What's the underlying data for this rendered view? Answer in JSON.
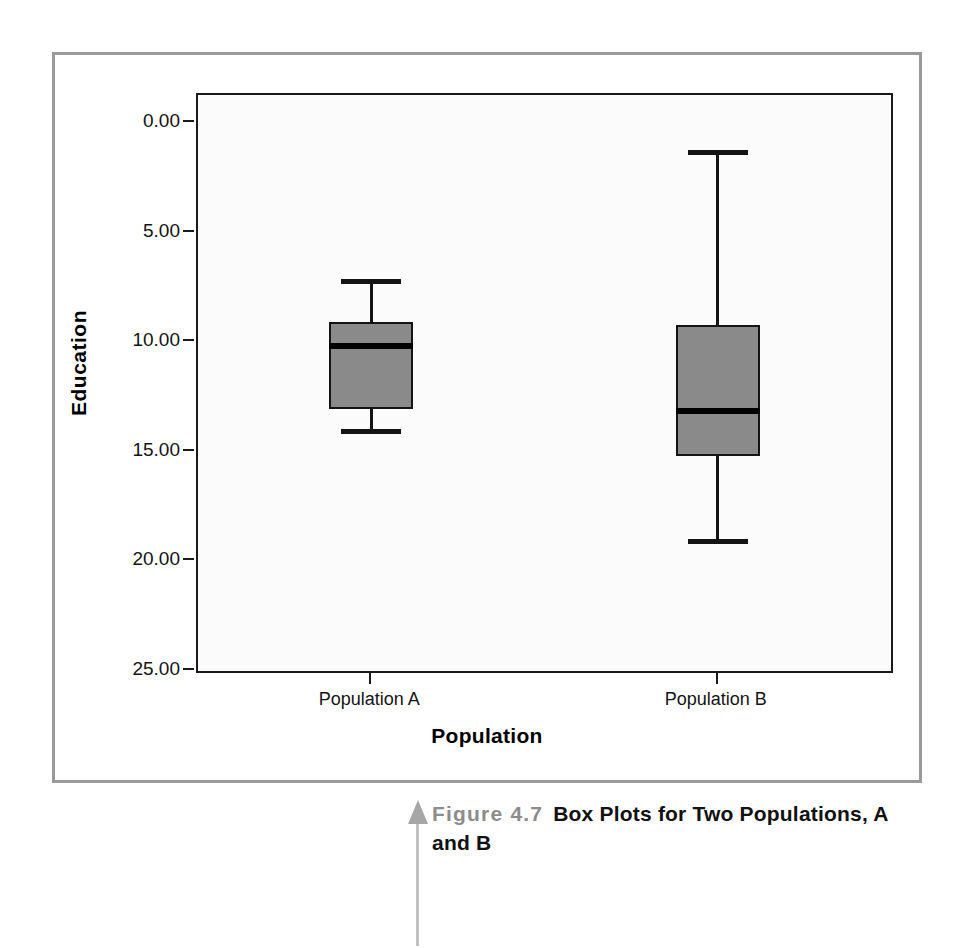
{
  "figure": {
    "caption_figure_number": "Figure 4.7",
    "caption_title": "Box Plots for Two Populations, A and B",
    "pointer_icon": "up-arrow-icon"
  },
  "axes": {
    "y_title": "Education",
    "x_title": "Population",
    "y_tick_labels": [
      "25.00",
      "20.00",
      "15.00",
      "10.00",
      "5.00",
      "0.00"
    ],
    "y_tick_values": [
      25,
      20,
      15,
      10,
      5,
      0
    ],
    "x_tick_labels": [
      "Population A",
      "Population B"
    ]
  },
  "colors": {
    "box_fill": "#8a8a8a",
    "box_stroke": "#141414",
    "panel_border": "#9a9a9a",
    "plot_background": "#fbfbfb",
    "caption_figno": "#8c8c8c",
    "caption_title": "#111111"
  },
  "chart_data": {
    "type": "box",
    "title": "Box Plots for Two Populations, A and B",
    "xlabel": "Population",
    "ylabel": "Education",
    "categories": [
      "Population A",
      "Population B"
    ],
    "ylim": [
      0,
      26.3
    ],
    "yticks": [
      0,
      5,
      10,
      15,
      20,
      25
    ],
    "grid": false,
    "legend": "none",
    "boxes": [
      {
        "name": "Population A",
        "whisker_low": 10.8,
        "q1": 11.95,
        "median": 14.85,
        "q3": 15.95,
        "whisker_high": 17.9
      },
      {
        "name": "Population B",
        "whisker_low": 5.8,
        "q1": 9.8,
        "median": 11.85,
        "q3": 15.8,
        "whisker_high": 23.8
      }
    ]
  }
}
